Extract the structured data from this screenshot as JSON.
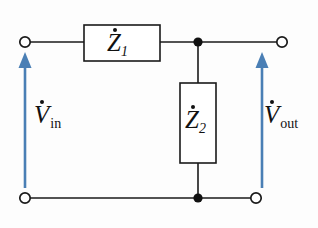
{
  "diagram": {
    "background_color": "#fdfdfd",
    "wire_color": "#1a1a1a",
    "arrow_color": "#4a7fb5",
    "components": {
      "z1": {
        "symbol": "Z",
        "subscript": "1",
        "accent": "dot",
        "full_label": "Ż1",
        "orientation": "horizontal"
      },
      "z2": {
        "symbol": "Z",
        "subscript": "2",
        "accent": "dot",
        "full_label": "Ż2",
        "orientation": "vertical"
      }
    },
    "voltages": {
      "vin": {
        "symbol": "V",
        "subscript": "in",
        "accent": "dot",
        "full_label": "V̇in",
        "arrow_direction": "up"
      },
      "vout": {
        "symbol": "V",
        "subscript": "out",
        "accent": "dot",
        "full_label": "V̇out",
        "arrow_direction": "up"
      }
    },
    "terminals": [
      {
        "name": "input-top",
        "type": "open"
      },
      {
        "name": "input-bottom",
        "type": "open"
      },
      {
        "name": "output-top",
        "type": "open"
      },
      {
        "name": "output-bottom",
        "type": "open"
      }
    ],
    "junctions": [
      {
        "name": "top-node",
        "type": "filled"
      },
      {
        "name": "bottom-node",
        "type": "filled"
      }
    ]
  }
}
